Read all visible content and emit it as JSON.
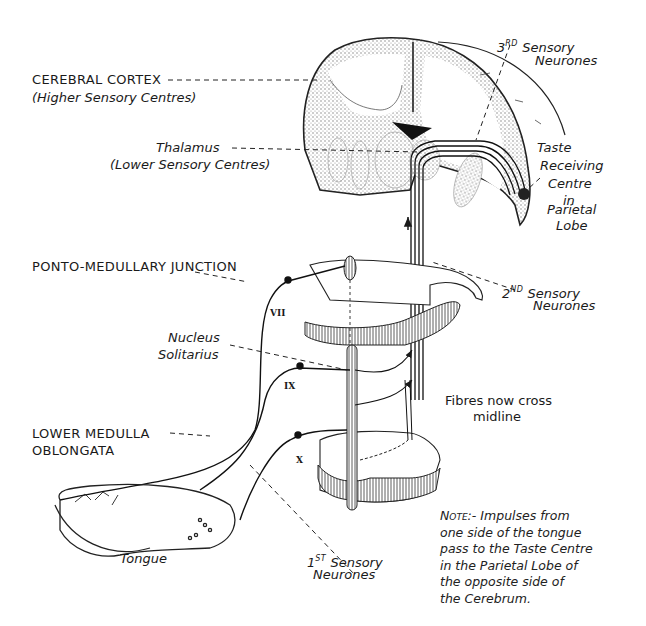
{
  "diagram": {
    "type": "anatomical-pathway"
  },
  "labels": {
    "cerebral_cortex": {
      "title": "CEREBRAL CORTEX",
      "subtitle": "(Higher Sensory Centres)"
    },
    "thalamus": {
      "title": "Thalamus",
      "subtitle": "(Lower Sensory Centres)"
    },
    "third_neurones": {
      "ordinal": "3",
      "suffix": "RD",
      "line1": "Sensory",
      "line2": "Neurones"
    },
    "taste_centre": {
      "lines": [
        "Taste",
        "Receiving",
        "Centre",
        "in",
        "Parietal",
        "Lobe"
      ]
    },
    "ponto_medullary": {
      "title": "PONTO-MEDULLARY JUNCTION"
    },
    "second_neurones": {
      "ordinal": "2",
      "suffix": "ND",
      "line1": "Sensory",
      "line2": "Neurones"
    },
    "nucleus_solitarius": {
      "line1": "Nucleus",
      "line2": "Solitarius"
    },
    "fibres_cross": {
      "line1": "Fibres now cross",
      "line2": "midline"
    },
    "lower_medulla": {
      "line1": "LOWER MEDULLA",
      "line2": "OBLONGATA"
    },
    "tongue": {
      "title": "Tongue"
    },
    "first_neurones": {
      "ordinal": "1",
      "suffix": "ST",
      "line1": "Sensory",
      "line2": "Neurones"
    }
  },
  "cranial_nerves": [
    {
      "numeral": "VII"
    },
    {
      "numeral": "IX"
    },
    {
      "numeral": "X"
    }
  ],
  "note": {
    "lead": "Note:-",
    "lines": [
      "Impulses from",
      "one side of the tongue",
      "pass to the Taste Centre",
      "in the Parietal Lobe of",
      "the opposite side of",
      "the Cerebrum."
    ]
  }
}
